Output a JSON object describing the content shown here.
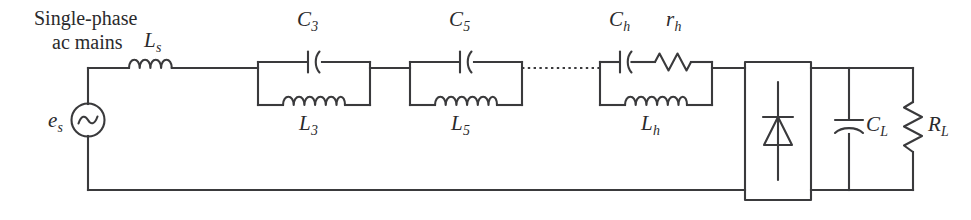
{
  "figure": {
    "kind": "circuit-schematic",
    "stroke_color": "#3a3a3c",
    "background_color": "#ffffff"
  },
  "source_caption": {
    "line1": "Single-phase",
    "line2": "ac mains"
  },
  "labels": {
    "source": {
      "base": "e",
      "sub": "s"
    },
    "series_inductor": {
      "base": "L",
      "sub": "s"
    },
    "tank1_cap": {
      "base": "C",
      "sub": "3"
    },
    "tank1_ind": {
      "base": "L",
      "sub": "3"
    },
    "tank2_cap": {
      "base": "C",
      "sub": "5"
    },
    "tank2_ind": {
      "base": "L",
      "sub": "5"
    },
    "tank3_cap": {
      "base": "C",
      "sub": "h"
    },
    "tank3_res": {
      "base": "r",
      "sub": "h"
    },
    "tank3_ind": {
      "base": "L",
      "sub": "h"
    },
    "load_cap": {
      "base": "C",
      "sub": "L"
    },
    "load_res": {
      "base": "R",
      "sub": "L"
    }
  },
  "components": {
    "ac_source": "ac-voltage-source",
    "series_inductor": "inductor",
    "tank1": "parallel-lc-trap",
    "tank2": "parallel-lc-trap",
    "tank3": "parallel-lcr-trap",
    "continuation": "dotted-ellipsis-wire",
    "rectifier": "diode-rectifier-block",
    "rectifier_symbol": "diode",
    "load_capacitor": "polarized-capacitor",
    "load_resistor": "resistor"
  }
}
